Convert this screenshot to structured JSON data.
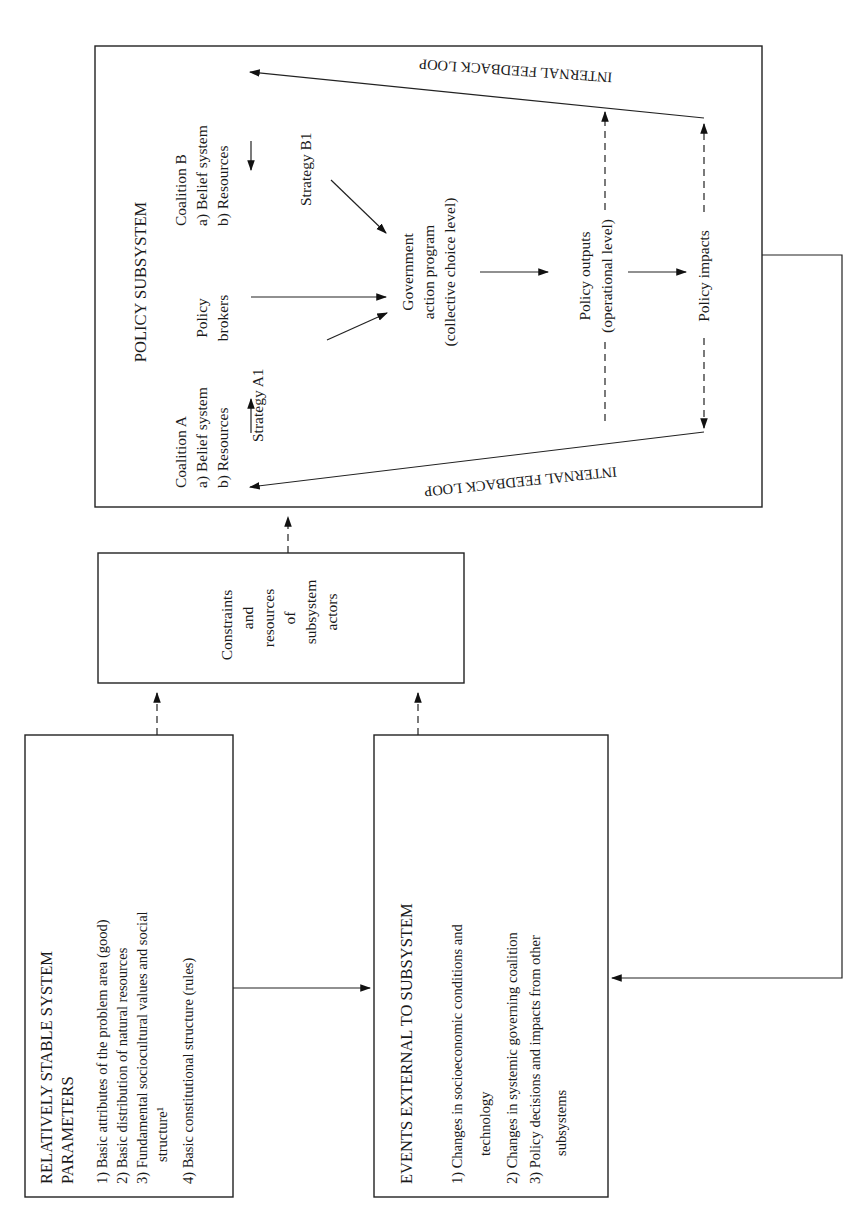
{
  "diagram": {
    "stable_params": {
      "title_line1": "RELATIVELY STABLE SYSTEM",
      "title_line2": "PARAMETERS",
      "items": [
        "1)  Basic attributes of the problem area (good)",
        "2)  Basic distribution of natural resources",
        "3)  Fundamental sociocultural values and social",
        "structure¹",
        "4)  Basic constitutional structure (rules)"
      ]
    },
    "external_events": {
      "title": "EVENTS EXTERNAL TO SUBSYSTEM",
      "items": [
        "1)  Changes in socioeconomic conditions and",
        "technology",
        "2)  Changes in systemic governing coalition",
        "3)  Policy decisions and impacts from other",
        "subsystems"
      ]
    },
    "constraints": {
      "lines": [
        "Constraints",
        "and",
        "resources",
        "of",
        "subsystem",
        "actors"
      ]
    },
    "policy_subsystem": {
      "title": "POLICY SUBSYSTEM",
      "coalition_a": {
        "name": "Coalition A",
        "belief": "a)  Belief system",
        "resources": "b)  Resources",
        "strategy": "Strategy A1"
      },
      "coalition_b": {
        "name": "Coalition B",
        "belief": "a)  Belief system",
        "resources": "b)  Resources",
        "strategy": "Strategy B1"
      },
      "brokers": [
        "Policy",
        "brokers"
      ],
      "government": [
        "Government",
        "action program",
        "(collective choice level)"
      ],
      "outputs": [
        "Policy outputs",
        "(operational level)"
      ],
      "impacts": "Policy impacts",
      "feedback_top": "INTERNAL FEEDBACK LOOP",
      "feedback_bottom": "INTERNAL FEEDBACK LOOP"
    },
    "colors": {
      "ink": "#1a1a1a",
      "paper": "#ffffff"
    }
  }
}
